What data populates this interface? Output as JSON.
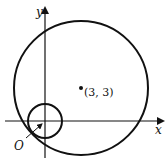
{
  "diagram": {
    "axes": {
      "x_label": "x",
      "y_label": "y",
      "origin_label": "O"
    },
    "large_circle": {
      "center_label": "(3, 3)",
      "center_coords": [
        3,
        3
      ]
    },
    "small_circle": {
      "center_coords": [
        0,
        0
      ]
    },
    "colors": {
      "stroke": "#111111",
      "background": "#ffffff"
    }
  }
}
